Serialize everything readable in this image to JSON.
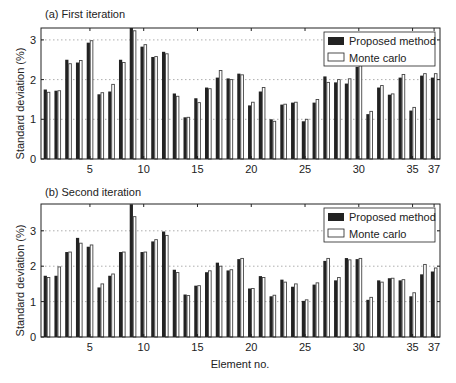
{
  "chart_data": [
    {
      "type": "bar",
      "title": "(a) First iteration",
      "xlabel": "",
      "ylabel": "Standard deviation (%)",
      "ylim": [
        0,
        3.3
      ],
      "yticks": [
        0,
        1,
        2,
        3
      ],
      "xticks": [
        5,
        10,
        15,
        20,
        25,
        30,
        35,
        37
      ],
      "grid": "dotted horizontal at 1, 2, 3",
      "legend_position": "upper right",
      "categories": [
        1,
        2,
        3,
        4,
        5,
        6,
        7,
        8,
        9,
        10,
        11,
        12,
        13,
        14,
        15,
        16,
        17,
        18,
        19,
        20,
        21,
        22,
        23,
        24,
        25,
        26,
        27,
        28,
        29,
        30,
        31,
        32,
        33,
        34,
        35,
        36,
        37
      ],
      "series": [
        {
          "name": "Proposed method",
          "color": "#222222",
          "values": [
            1.75,
            1.72,
            2.5,
            2.43,
            2.93,
            1.63,
            1.7,
            2.5,
            3.3,
            2.83,
            2.57,
            2.7,
            1.65,
            1.05,
            1.53,
            1.8,
            2.05,
            2.03,
            2.15,
            1.35,
            1.7,
            1.0,
            1.37,
            1.42,
            0.95,
            1.42,
            2.08,
            1.93,
            1.9,
            2.32,
            1.13,
            1.8,
            1.62,
            2.05,
            1.22,
            2.1,
            2.05
          ]
        },
        {
          "name": "Monte carlo",
          "color": "#ffffff",
          "values": [
            1.68,
            1.72,
            2.4,
            2.48,
            2.98,
            1.67,
            1.88,
            2.43,
            3.23,
            2.88,
            2.58,
            2.65,
            1.58,
            1.05,
            1.42,
            1.77,
            2.23,
            2.0,
            2.12,
            1.43,
            1.8,
            0.95,
            1.38,
            1.43,
            1.0,
            1.5,
            1.93,
            2.0,
            2.02,
            2.35,
            1.2,
            1.85,
            1.64,
            2.13,
            1.3,
            2.15,
            2.15
          ]
        }
      ]
    },
    {
      "type": "bar",
      "title": "(b) Second iteration",
      "xlabel": "Element no.",
      "ylabel": "Standard deviation (%)",
      "ylim": [
        0,
        3.75
      ],
      "yticks": [
        0,
        1,
        2,
        3
      ],
      "xticks": [
        5,
        10,
        15,
        20,
        25,
        30,
        35,
        37
      ],
      "grid": "dotted horizontal at 1, 2, 3",
      "legend_position": "upper right",
      "categories": [
        1,
        2,
        3,
        4,
        5,
        6,
        7,
        8,
        9,
        10,
        11,
        12,
        13,
        14,
        15,
        16,
        17,
        18,
        19,
        20,
        21,
        22,
        23,
        24,
        25,
        26,
        27,
        28,
        29,
        30,
        31,
        32,
        33,
        34,
        35,
        36,
        37
      ],
      "series": [
        {
          "name": "Proposed method",
          "color": "#222222",
          "values": [
            1.73,
            1.73,
            2.4,
            2.8,
            2.55,
            1.4,
            1.73,
            2.4,
            3.75,
            2.4,
            2.7,
            2.98,
            1.9,
            1.2,
            1.45,
            1.83,
            2.1,
            1.88,
            2.2,
            1.37,
            1.72,
            1.15,
            1.62,
            1.42,
            1.02,
            1.48,
            2.15,
            1.6,
            2.23,
            2.2,
            1.05,
            1.6,
            1.66,
            1.6,
            1.15,
            1.77,
            1.85
          ]
        },
        {
          "name": "Monte carlo",
          "color": "#ffffff",
          "values": [
            1.68,
            1.98,
            2.4,
            2.65,
            2.6,
            1.5,
            1.78,
            2.4,
            3.4,
            2.4,
            2.75,
            2.87,
            1.82,
            1.17,
            1.45,
            1.87,
            2.0,
            1.9,
            2.22,
            1.37,
            1.68,
            1.18,
            1.55,
            1.5,
            1.05,
            1.53,
            2.22,
            1.68,
            2.18,
            2.22,
            1.12,
            1.55,
            1.66,
            1.62,
            1.25,
            2.05,
            1.95
          ]
        }
      ]
    }
  ],
  "legend": {
    "proposed": "Proposed method",
    "monte": "Monte carlo"
  },
  "titles": {
    "a": "(a) First iteration",
    "b": "(b) Second iteration"
  },
  "ylabel": "Standard deviation (%)",
  "xlabel": "Element no."
}
